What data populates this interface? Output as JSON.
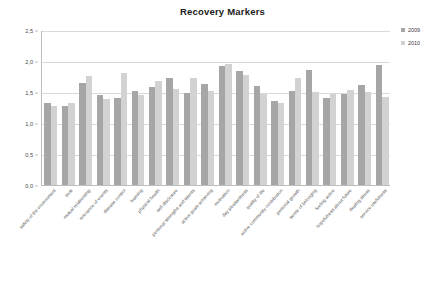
{
  "chart_data": {
    "type": "bar",
    "title": "Recovery Markers",
    "xlabel": "",
    "ylabel": "",
    "ylim": [
      0,
      2.5
    ],
    "ytick_labels": [
      "2,5",
      "2,0",
      "1,5",
      "1,0",
      "0,5",
      "0,0"
    ],
    "ytick_values": [
      2.5,
      2.0,
      1.5,
      1.0,
      0.5,
      0.0
    ],
    "grid": true,
    "legend_position": "right",
    "decimal_separator": ",",
    "categories": [
      "safety of the environment",
      "trust",
      "mutual relationship",
      "relevance of events",
      "disease control",
      "learning",
      "physical health",
      "self-disclosure",
      "personal strengths and talents",
      "active goals achieving",
      "motivation",
      "day pleasantness",
      "quality of life",
      "active community contribution",
      "personal growth",
      "sense of belonging",
      "feeling active",
      "hopefulness about future",
      "dealing stress",
      "service usefulness"
    ],
    "series": [
      {
        "name": "2009",
        "color": "#a6a6a6",
        "values": [
          1.33,
          1.28,
          1.64,
          1.45,
          1.4,
          1.52,
          1.58,
          1.72,
          1.48,
          1.63,
          1.92,
          1.84,
          1.6,
          1.35,
          1.52,
          1.86,
          1.4,
          1.46,
          1.62,
          1.94
        ]
      },
      {
        "name": "2010",
        "color": "#d2d2d2",
        "values": [
          1.28,
          1.33,
          1.76,
          1.38,
          1.8,
          1.45,
          1.68,
          1.55,
          1.72,
          1.52,
          1.95,
          1.77,
          1.47,
          1.33,
          1.72,
          1.5,
          1.46,
          1.54,
          1.5,
          1.42
        ]
      }
    ]
  },
  "legend": {
    "items": [
      {
        "label": "2009"
      },
      {
        "label": "2010"
      }
    ]
  }
}
